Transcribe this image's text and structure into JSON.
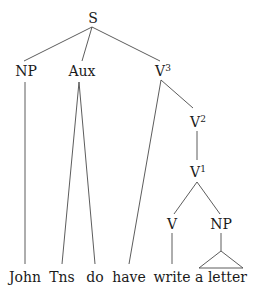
{
  "tree": {
    "root": "S",
    "level1": {
      "np": "NP",
      "aux": "Aux",
      "v3": "V",
      "v3_sup": "3"
    },
    "v2": "V",
    "v2_sup": "2",
    "v1": "V",
    "v1_sup": "1",
    "v": "V",
    "np2": "NP",
    "leaves": [
      "John",
      "Tns",
      "do",
      "have",
      "write",
      "a letter"
    ]
  }
}
